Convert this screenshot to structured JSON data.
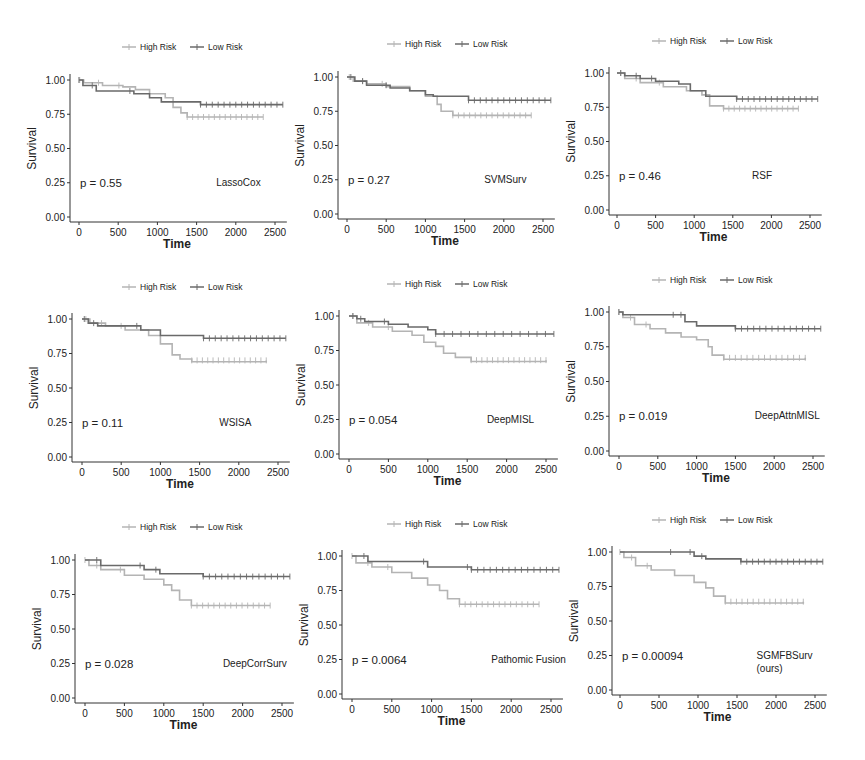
{
  "figure": {
    "legend": {
      "high_label": "High Risk",
      "low_label": "Low Risk"
    },
    "colors": {
      "high": "#b4b4b4",
      "low": "#6a6a6a",
      "axis": "#333333",
      "text": "#222222"
    },
    "ylabel": "Survival",
    "xlabel": "Time",
    "y_ticks": [
      "0.00",
      "0.25",
      "0.50",
      "0.75",
      "1.00"
    ],
    "x_ticks": [
      "0",
      "500",
      "1000",
      "1500",
      "2000",
      "2500"
    ]
  },
  "chart_data": [
    {
      "type": "line",
      "subtype": "kaplan-meier",
      "model": "LassoCox",
      "p_value": "p = 0.55",
      "xlabel": "Time",
      "ylabel": "Survival",
      "xlim": [
        0,
        2600
      ],
      "ylim": [
        0,
        1.0
      ],
      "grid": false,
      "legend_position": "top",
      "series": [
        {
          "name": "High Risk",
          "x": [
            0,
            60,
            300,
            560,
            720,
            900,
            1100,
            1200,
            1300,
            1380,
            2350
          ],
          "y": [
            1.0,
            0.98,
            0.96,
            0.95,
            0.93,
            0.9,
            0.87,
            0.8,
            0.76,
            0.73,
            0.73
          ]
        },
        {
          "name": "Low Risk",
          "x": [
            0,
            50,
            220,
            700,
            900,
            1050,
            1220,
            1550,
            2600
          ],
          "y": [
            1.0,
            0.96,
            0.92,
            0.9,
            0.87,
            0.84,
            0.84,
            0.82,
            0.82
          ]
        }
      ]
    },
    {
      "type": "line",
      "subtype": "kaplan-meier",
      "model": "SVMSurv",
      "p_value": "p = 0.27",
      "xlabel": "Time",
      "ylabel": "Survival",
      "xlim": [
        0,
        2600
      ],
      "ylim": [
        0,
        1.0
      ],
      "grid": false,
      "legend_position": "top",
      "series": [
        {
          "name": "High Risk",
          "x": [
            0,
            80,
            250,
            500,
            800,
            1000,
            1150,
            1200,
            1350,
            2350
          ],
          "y": [
            1.0,
            0.97,
            0.95,
            0.93,
            0.9,
            0.86,
            0.8,
            0.75,
            0.72,
            0.72
          ]
        },
        {
          "name": "Low Risk",
          "x": [
            0,
            100,
            250,
            550,
            800,
            1000,
            1100,
            1550,
            2600
          ],
          "y": [
            1.0,
            0.97,
            0.94,
            0.92,
            0.9,
            0.87,
            0.86,
            0.83,
            0.83
          ]
        }
      ]
    },
    {
      "type": "line",
      "subtype": "kaplan-meier",
      "model": "RSF",
      "p_value": "p = 0.46",
      "xlabel": "Time",
      "ylabel": "Survival",
      "xlim": [
        0,
        2600
      ],
      "ylim": [
        0,
        1.0
      ],
      "grid": false,
      "legend_position": "top",
      "series": [
        {
          "name": "High Risk",
          "x": [
            0,
            100,
            300,
            600,
            900,
            1100,
            1200,
            1380,
            2350
          ],
          "y": [
            1.0,
            0.96,
            0.93,
            0.9,
            0.87,
            0.84,
            0.76,
            0.74,
            0.74
          ]
        },
        {
          "name": "Low Risk",
          "x": [
            0,
            100,
            300,
            500,
            800,
            950,
            1150,
            1550,
            2600
          ],
          "y": [
            1.0,
            0.98,
            0.96,
            0.94,
            0.92,
            0.87,
            0.83,
            0.81,
            0.81
          ]
        }
      ]
    },
    {
      "type": "line",
      "subtype": "kaplan-meier",
      "model": "WSISA",
      "p_value": "p = 0.11",
      "xlabel": "Time",
      "ylabel": "Survival",
      "xlim": [
        0,
        2600
      ],
      "ylim": [
        0,
        1.0
      ],
      "grid": false,
      "legend_position": "top",
      "series": [
        {
          "name": "High Risk",
          "x": [
            0,
            100,
            300,
            550,
            850,
            1000,
            1150,
            1250,
            1400,
            2350
          ],
          "y": [
            1.0,
            0.97,
            0.95,
            0.92,
            0.88,
            0.82,
            0.74,
            0.71,
            0.69,
            0.7
          ]
        },
        {
          "name": "Low Risk",
          "x": [
            0,
            80,
            200,
            750,
            1000,
            1550,
            2600
          ],
          "y": [
            1.0,
            0.97,
            0.95,
            0.92,
            0.88,
            0.86,
            0.86
          ]
        }
      ]
    },
    {
      "type": "line",
      "subtype": "kaplan-meier",
      "model": "DeepMISL",
      "p_value": "p = 0.054",
      "xlabel": "Time",
      "ylabel": "Survival",
      "xlim": [
        0,
        2600
      ],
      "ylim": [
        0,
        1.0
      ],
      "grid": false,
      "legend_position": "top",
      "series": [
        {
          "name": "High Risk",
          "x": [
            0,
            100,
            300,
            550,
            800,
            950,
            1100,
            1200,
            1350,
            1550,
            2500
          ],
          "y": [
            1.0,
            0.95,
            0.92,
            0.89,
            0.86,
            0.81,
            0.78,
            0.73,
            0.7,
            0.67,
            0.68
          ]
        },
        {
          "name": "Low Risk",
          "x": [
            0,
            100,
            200,
            500,
            750,
            1000,
            1100,
            2600
          ],
          "y": [
            1.0,
            0.98,
            0.96,
            0.94,
            0.92,
            0.9,
            0.87,
            0.87
          ]
        }
      ]
    },
    {
      "type": "line",
      "subtype": "kaplan-meier",
      "model": "DeepAttnMISL",
      "p_value": "p = 0.019",
      "xlabel": "Time",
      "ylabel": "Survival",
      "xlim": [
        0,
        2600
      ],
      "ylim": [
        0,
        1.0
      ],
      "grid": false,
      "legend_position": "top",
      "series": [
        {
          "name": "High Risk",
          "x": [
            0,
            50,
            200,
            400,
            600,
            800,
            1000,
            1150,
            1200,
            1350,
            2400
          ],
          "y": [
            1.0,
            0.96,
            0.91,
            0.88,
            0.85,
            0.82,
            0.8,
            0.75,
            0.69,
            0.66,
            0.67
          ]
        },
        {
          "name": "Low Risk",
          "x": [
            0,
            50,
            750,
            850,
            1000,
            1500,
            2600
          ],
          "y": [
            1.0,
            0.98,
            0.98,
            0.93,
            0.9,
            0.88,
            0.88
          ]
        }
      ]
    },
    {
      "type": "line",
      "subtype": "kaplan-meier",
      "model": "DeepCorrSurv",
      "p_value": "p = 0.028",
      "xlabel": "Time",
      "ylabel": "Survival",
      "xlim": [
        0,
        2600
      ],
      "ylim": [
        0,
        1.0
      ],
      "grid": false,
      "legend_position": "top",
      "series": [
        {
          "name": "High Risk",
          "x": [
            0,
            50,
            200,
            500,
            750,
            1000,
            1100,
            1200,
            1350,
            2350
          ],
          "y": [
            1.0,
            0.96,
            0.93,
            0.89,
            0.86,
            0.82,
            0.78,
            0.71,
            0.67,
            0.67
          ]
        },
        {
          "name": "Low Risk",
          "x": [
            0,
            200,
            750,
            950,
            1500,
            2600
          ],
          "y": [
            1.0,
            0.96,
            0.93,
            0.9,
            0.88,
            0.88
          ]
        }
      ]
    },
    {
      "type": "line",
      "subtype": "kaplan-meier",
      "model": "Pathomic Fusion",
      "p_value": "p = 0.0064",
      "xlabel": "Time",
      "ylabel": "Survival",
      "xlim": [
        0,
        2600
      ],
      "ylim": [
        0,
        1.0
      ],
      "grid": false,
      "legend_position": "top",
      "series": [
        {
          "name": "High Risk",
          "x": [
            0,
            50,
            250,
            500,
            750,
            950,
            1100,
            1200,
            1350,
            2350
          ],
          "y": [
            1.0,
            0.95,
            0.92,
            0.88,
            0.84,
            0.79,
            0.75,
            0.69,
            0.65,
            0.65
          ]
        },
        {
          "name": "Low Risk",
          "x": [
            0,
            200,
            950,
            1500,
            2600
          ],
          "y": [
            1.0,
            0.96,
            0.92,
            0.9,
            0.9
          ]
        }
      ]
    },
    {
      "type": "line",
      "subtype": "kaplan-meier",
      "model": "SGMFBSurv (ours)",
      "p_value": "p = 0.00094",
      "xlabel": "Time",
      "ylabel": "Survival",
      "xlim": [
        0,
        2600
      ],
      "ylim": [
        0,
        1.0
      ],
      "grid": false,
      "legend_position": "top",
      "series": [
        {
          "name": "High Risk",
          "x": [
            0,
            50,
            200,
            400,
            700,
            950,
            1100,
            1200,
            1350,
            2350
          ],
          "y": [
            1.0,
            0.96,
            0.9,
            0.87,
            0.83,
            0.78,
            0.74,
            0.68,
            0.63,
            0.64
          ]
        },
        {
          "name": "Low Risk",
          "x": [
            0,
            700,
            950,
            1100,
            1550,
            2600
          ],
          "y": [
            1.0,
            1.0,
            0.97,
            0.95,
            0.93,
            0.93
          ]
        }
      ]
    }
  ],
  "panels": [
    {
      "model_line1": "LassoCox",
      "model_line2": "",
      "p_text": "p = 0.55"
    },
    {
      "model_line1": "SVMSurv",
      "model_line2": "",
      "p_text": "p = 0.27"
    },
    {
      "model_line1": "RSF",
      "model_line2": "",
      "p_text": "p = 0.46"
    },
    {
      "model_line1": "WSISA",
      "model_line2": "",
      "p_text": "p = 0.11"
    },
    {
      "model_line1": "DeepMISL",
      "model_line2": "",
      "p_text": "p = 0.054"
    },
    {
      "model_line1": "DeepAttnMISL",
      "model_line2": "",
      "p_text": "p = 0.019"
    },
    {
      "model_line1": "DeepCorrSurv",
      "model_line2": "",
      "p_text": "p = 0.028"
    },
    {
      "model_line1": "Pathomic Fusion",
      "model_line2": "",
      "p_text": "p = 0.0064"
    },
    {
      "model_line1": "SGMFBSurv",
      "model_line2": "(ours)",
      "p_text": "p = 0.00094"
    }
  ]
}
